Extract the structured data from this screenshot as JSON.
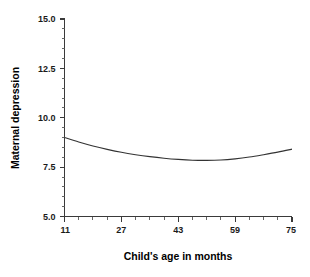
{
  "chart_data": {
    "type": "line",
    "title": "",
    "xlabel": "Child's age in months",
    "ylabel": "Maternal depression",
    "xlim": [
      11,
      75
    ],
    "ylim": [
      5.0,
      15.0
    ],
    "grid": false,
    "legend": "none",
    "x_ticks": [
      11,
      27,
      43,
      59,
      75
    ],
    "x_tick_labels": [
      "11",
      "27",
      "43",
      "59",
      "75"
    ],
    "y_ticks": [
      5.0,
      7.5,
      10.0,
      12.5,
      15.0
    ],
    "y_tick_labels": [
      "5.0",
      "7.5",
      "10.0",
      "12.5",
      "15.0"
    ],
    "x_minor_tick_interval": 4,
    "y_minor_tick_interval": 0.5,
    "series": [
      {
        "name": "Maternal depression",
        "color": "#333333",
        "x": [
          11,
          15,
          19,
          23,
          27,
          31,
          35,
          39,
          43,
          47,
          51,
          55,
          59,
          63,
          67,
          71,
          75
        ],
        "y": [
          9.0,
          8.77,
          8.57,
          8.4,
          8.25,
          8.13,
          8.03,
          7.95,
          7.89,
          7.85,
          7.84,
          7.86,
          7.92,
          8.01,
          8.13,
          8.26,
          8.41
        ]
      }
    ]
  },
  "axis": {
    "x_title": "Child's age in months",
    "y_title": "Maternal depression",
    "x_labels": [
      "11",
      "27",
      "43",
      "59",
      "75"
    ],
    "y_labels": [
      "5.0",
      "7.5",
      "10.0",
      "12.5",
      "15.0"
    ]
  },
  "colors": {
    "curve": "#333333",
    "axis": "#3a3a3a",
    "text": "#000000",
    "background": "#ffffff"
  }
}
